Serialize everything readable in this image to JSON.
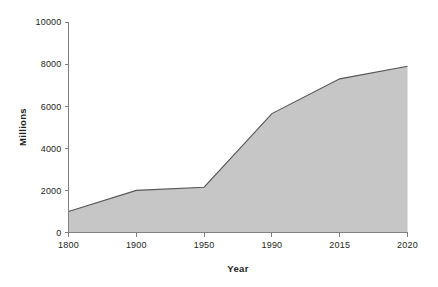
{
  "chart_data": {
    "type": "area",
    "title": "",
    "xlabel": "Year",
    "ylabel": "Millions",
    "categories": [
      "1800",
      "1900",
      "1950",
      "1990",
      "2015",
      "2020"
    ],
    "values": [
      1000,
      2000,
      2150,
      5650,
      7300,
      7900
    ],
    "series": [
      {
        "name": "Population",
        "values": [
          1000,
          2000,
          2150,
          5650,
          7300,
          7900
        ]
      }
    ],
    "ylim": [
      0,
      10000
    ],
    "y_ticks": [
      "0",
      "2000",
      "4000",
      "6000",
      "8000",
      "10000"
    ],
    "y_tick_values": [
      0,
      2000,
      4000,
      6000,
      8000,
      10000
    ],
    "x_ticks": [
      "1800",
      "1900",
      "1950",
      "1990",
      "2015",
      "2020"
    ],
    "grid": false,
    "legend": "none",
    "colors": {
      "area_fill": "#c6c6c6",
      "series_line": "#555555",
      "axis": "#808080",
      "text": "#231f20",
      "background": "#ffffff"
    }
  },
  "labels": {
    "y_axis_title": "Millions",
    "x_axis_title": "Year"
  }
}
